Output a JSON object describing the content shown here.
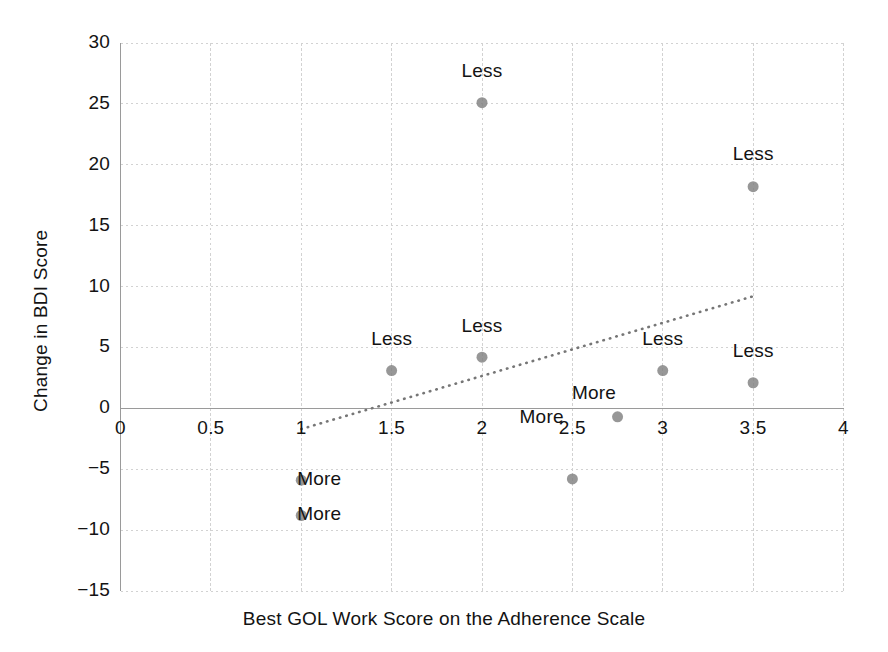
{
  "chart_data": {
    "type": "scatter",
    "title": "",
    "xlabel": "Best GOL Work Score on the Adherence Scale",
    "ylabel": "Change in BDI Score",
    "xlim": [
      0,
      4
    ],
    "ylim": [
      -15,
      30
    ],
    "xticks": [
      "0",
      "0.5",
      "1",
      "1.5",
      "2",
      "2.5",
      "3",
      "3.5",
      "4"
    ],
    "xtick_values": [
      0,
      0.5,
      1,
      1.5,
      2,
      2.5,
      3,
      3.5,
      4
    ],
    "yticks": [
      "30",
      "25",
      "20",
      "15",
      "10",
      "5",
      "0",
      "−5",
      "−10",
      "−15"
    ],
    "ytick_values": [
      30,
      25,
      20,
      15,
      10,
      5,
      0,
      -5,
      -10,
      -15
    ],
    "grid": true,
    "legend": "none",
    "marker_color": "#808080",
    "marker_size": 11,
    "points": [
      {
        "x": 2.0,
        "y": 25.1,
        "label": "Less",
        "label_pos": "above"
      },
      {
        "x": 3.5,
        "y": 18.2,
        "label": "Less",
        "label_pos": "above"
      },
      {
        "x": 1.5,
        "y": 3.1,
        "label": "Less",
        "label_pos": "above"
      },
      {
        "x": 2.0,
        "y": 4.2,
        "label": "Less",
        "label_pos": "above"
      },
      {
        "x": 3.0,
        "y": 3.1,
        "label": "Less",
        "label_pos": "above"
      },
      {
        "x": 3.5,
        "y": 2.1,
        "label": "Less",
        "label_pos": "above"
      },
      {
        "x": 2.75,
        "y": -0.7,
        "label": "More",
        "label_pos": "above-left"
      },
      {
        "x": 2.75,
        "y": -0.7,
        "label": "More",
        "label_pos": "left"
      },
      {
        "x": 1.0,
        "y": -5.9,
        "label": "More",
        "label_pos": "right"
      },
      {
        "x": 1.0,
        "y": -8.8,
        "label": "More",
        "label_pos": "right"
      },
      {
        "x": 2.5,
        "y": -5.8,
        "label": "",
        "label_pos": "none"
      }
    ],
    "trendline": {
      "type": "dotted",
      "color": "#767676",
      "x0": 1.0,
      "y0": -1.7,
      "x1": 3.5,
      "y1": 9.2
    },
    "annotations": [
      {
        "text": "Less",
        "x": 2.0,
        "y": 27.6
      },
      {
        "text": "Less",
        "x": 3.5,
        "y": 20.8
      },
      {
        "text": "Less",
        "x": 1.5,
        "y": 5.6
      },
      {
        "text": "Less",
        "x": 2.0,
        "y": 6.7
      },
      {
        "text": "Less",
        "x": 3.0,
        "y": 5.6
      },
      {
        "text": "Less",
        "x": 3.5,
        "y": 4.6
      },
      {
        "text": "More",
        "x": 2.62,
        "y": 1.2
      },
      {
        "text": "More",
        "x": 2.33,
        "y": -0.8
      },
      {
        "text": "More",
        "x": 1.1,
        "y": -5.9
      },
      {
        "text": "More",
        "x": 1.1,
        "y": -8.8
      }
    ]
  },
  "axes": {
    "x_title": "Best GOL Work Score on the Adherence Scale",
    "y_title": "Change in BDI Score"
  }
}
